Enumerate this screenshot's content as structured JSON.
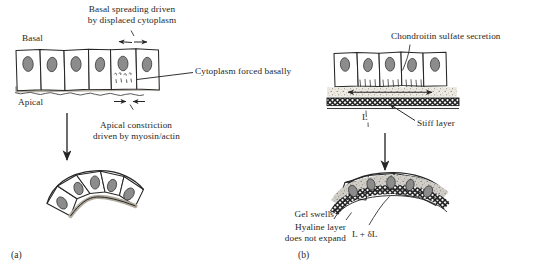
{
  "figure": {
    "title_implicit": "Epithelial bending mechanisms",
    "background": "#ffffff",
    "ink": "#262626",
    "nucleus_fill": "#8c8c8c",
    "gel_fill": "#e8e4dc",
    "stiff_layer_fill": "#3a3a3a",
    "apical_band_fill": "#b3aca0"
  },
  "panel_a": {
    "id": "(a)",
    "labels": {
      "basal": "Basal",
      "apical": "Apical",
      "top_caption_line1": "Basal spreading driven",
      "top_caption_line2": "by displaced cytoplasm",
      "right_callout": "Cytoplasm forced basally",
      "bottom_caption_line1": "Apical constriction",
      "bottom_caption_line2": "driven by myosin/actin"
    },
    "cells_flat": 6,
    "cells_fan": 5,
    "arrows": {
      "basal_spread": "outward",
      "apical_constrict": "inward",
      "transition": "down"
    }
  },
  "panel_b": {
    "id": "(b)",
    "labels": {
      "top_caption": "Chondroitin sulfate secretion",
      "length_initial": "L",
      "stiff_layer": "Stiff layer",
      "gel_swells": "Gel swells",
      "hyaline_line1": "Hyaline layer",
      "hyaline_line2": "does not expand",
      "length_final": "L + δL"
    },
    "cells_flat": 5,
    "cells_fan": 5,
    "arrows": {
      "gel_expansion": "bidirectional-horizontal",
      "transition": "down"
    }
  }
}
